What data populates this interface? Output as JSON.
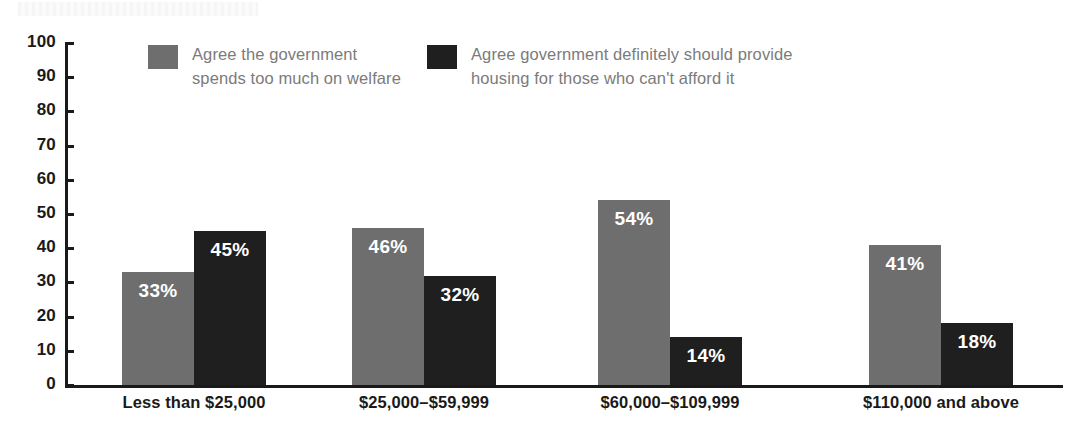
{
  "chart_data": {
    "type": "bar",
    "title": "",
    "subtitle": "",
    "xlabel": "",
    "ylabel": "",
    "ylim": [
      0,
      100
    ],
    "yticks": [
      0,
      10,
      20,
      30,
      40,
      50,
      60,
      70,
      80,
      90,
      100
    ],
    "grid": false,
    "legend_position": "top",
    "categories": [
      "Less than $25,000",
      "$25,000–$59,999",
      "$60,000–$109,999",
      "$110,000 and above"
    ],
    "series": [
      {
        "name": "Agree the government\nspends too much on welfare",
        "color": "#6e6e6e",
        "values": [
          33,
          46,
          54,
          41
        ],
        "labels": [
          "33%",
          "46%",
          "54%",
          "41%"
        ]
      },
      {
        "name": "Agree government definitely should provide\nhousing for those who can't afford it",
        "color": "#1f1f1f",
        "values": [
          45,
          32,
          14,
          18
        ],
        "labels": [
          "45%",
          "32%",
          "14%",
          "18%"
        ]
      }
    ]
  },
  "axis": {
    "y_tick_labels": [
      "100",
      "90",
      "80",
      "70",
      "60",
      "50",
      "40",
      "30",
      "20",
      "10",
      "0"
    ],
    "line_color": "#1a1a1a"
  },
  "legend": {
    "items": [
      {
        "swatch_color": "#6e6e6e",
        "label": "Agree the government\nspends too much on welfare"
      },
      {
        "swatch_color": "#1f1f1f",
        "label": "Agree government definitely should provide\nhousing for those who can't afford it"
      }
    ]
  }
}
